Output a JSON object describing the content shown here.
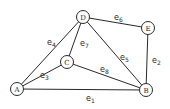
{
  "graph": {
    "nodes": [
      {
        "id": "A",
        "label": "A",
        "x": 17,
        "y": 89
      },
      {
        "id": "B",
        "label": "B",
        "x": 146,
        "y": 90
      },
      {
        "id": "C",
        "label": "C",
        "x": 67,
        "y": 62
      },
      {
        "id": "D",
        "label": "D",
        "x": 83,
        "y": 17
      },
      {
        "id": "E",
        "label": "E",
        "x": 148,
        "y": 28
      }
    ],
    "edges": [
      {
        "id": "e1",
        "label": "e",
        "sub": "1",
        "from": "A",
        "to": "B",
        "lx": 86,
        "ly": 101
      },
      {
        "id": "e2",
        "label": "e",
        "sub": "2",
        "from": "E",
        "to": "B",
        "lx": 152,
        "ly": 63
      },
      {
        "id": "e3",
        "label": "e",
        "sub": "3",
        "from": "A",
        "to": "C",
        "lx": 40,
        "ly": 78
      },
      {
        "id": "e4",
        "label": "e",
        "sub": "4",
        "from": "A",
        "to": "D",
        "lx": 47,
        "ly": 45
      },
      {
        "id": "e5",
        "label": "e",
        "sub": "5",
        "from": "D",
        "to": "B",
        "lx": 120,
        "ly": 60
      },
      {
        "id": "e6",
        "label": "e",
        "sub": "6",
        "from": "D",
        "to": "E",
        "lx": 114,
        "ly": 20
      },
      {
        "id": "e7",
        "label": "e",
        "sub": "7",
        "from": "D",
        "to": "C",
        "lx": 80,
        "ly": 46
      },
      {
        "id": "e8",
        "label": "e",
        "sub": "8",
        "from": "C",
        "to": "B",
        "lx": 100,
        "ly": 72
      }
    ]
  }
}
